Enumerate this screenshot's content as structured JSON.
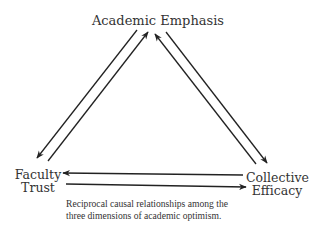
{
  "diagram": {
    "nodes": {
      "top": {
        "line1": "Academic Emphasis"
      },
      "left": {
        "line1": "Faculty",
        "line2": "Trust"
      },
      "right": {
        "line1": "Collective",
        "line2": "Efficacy"
      }
    },
    "edges": [
      {
        "from": "Academic Emphasis",
        "to": "Faculty Trust"
      },
      {
        "from": "Faculty Trust",
        "to": "Academic Emphasis"
      },
      {
        "from": "Collective Efficacy",
        "to": "Academic Emphasis"
      },
      {
        "from": "Academic Emphasis",
        "to": "Collective Efficacy"
      },
      {
        "from": "Collective Efficacy",
        "to": "Faculty Trust"
      },
      {
        "from": "Faculty Trust",
        "to": "Collective Efficacy"
      }
    ],
    "caption": {
      "line1": "Reciprocal causal relationships among the",
      "line2": "three dimensions of academic optimism."
    },
    "colors": {
      "stroke": "#222222",
      "text": "#333333",
      "background": "#ffffff"
    }
  }
}
